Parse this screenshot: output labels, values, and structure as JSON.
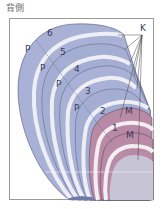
{
  "title": "背側",
  "labels": {
    "K": "K",
    "P1": "P",
    "P2": "P",
    "P3": "P",
    "P4": "P",
    "M1": "M",
    "M2": "M",
    "n1": "1",
    "n2": "2",
    "n3": "3",
    "n4": "4",
    "n5": "5",
    "n6": "6"
  },
  "colors": {
    "p_layer": "#a9b2d6",
    "p_layer_dark": "#9aa4cc",
    "m_layer": "#b98aa6",
    "m_inner": "#c7c4d6",
    "separator": "#eeeef4",
    "frame": "#9a9a9a"
  }
}
